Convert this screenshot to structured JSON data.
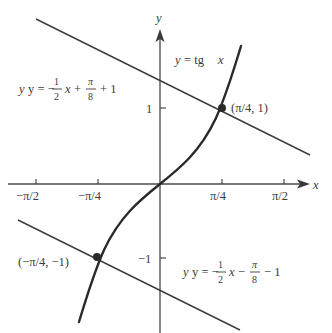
{
  "figure": {
    "colors": {
      "curve": "#2a2a2a",
      "lines": "#3c3c3c",
      "axes": "#4a4a4a",
      "text": "#3a3a3a",
      "background": "#ffffff"
    }
  },
  "axes": {
    "x_label": "x",
    "y_label": "y",
    "x_ticks": [
      {
        "value": "-π/2",
        "label": "−π/2"
      },
      {
        "value": "-π/4",
        "label": "−π/4"
      },
      {
        "value": "π/4",
        "label": "π/4"
      },
      {
        "value": "π/2",
        "label": "π/2"
      }
    ],
    "y_ticks": [
      {
        "value": 1,
        "label": "1"
      },
      {
        "value": -1,
        "label": "−1"
      }
    ]
  },
  "curve": {
    "name": "tan",
    "label": "y = tg x",
    "label_lhs": "y",
    "label_eq": "= tg",
    "label_var": "x"
  },
  "tangent_upper": {
    "equation": "y = −(1/2)x + π/8 + 1",
    "lhs": "y = −",
    "frac1_num": "1",
    "frac1_den": "2",
    "mid": "x +",
    "frac2_num": "π",
    "frac2_den": "8",
    "tail": "+ 1"
  },
  "tangent_lower": {
    "equation": "y = −(1/2)x − π/8 − 1",
    "lhs": "y = −",
    "frac1_num": "1",
    "frac1_den": "2",
    "mid": "x −",
    "frac2_num": "π",
    "frac2_den": "8",
    "tail": "− 1"
  },
  "points": [
    {
      "label": "(π/4, 1)",
      "x": "π/4",
      "y": 1
    },
    {
      "label": "(−π/4, −1)",
      "x": "-π/4",
      "y": -1
    }
  ]
}
